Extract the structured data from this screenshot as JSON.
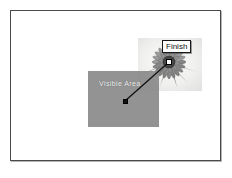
{
  "canvas": {
    "width": 232,
    "height": 178,
    "background_color": "#ffffff",
    "frame_border_color": "#4a4a4a"
  },
  "frame": {
    "name": "slide-frame"
  },
  "photo": {
    "subject": "flower-photograph",
    "description": "grayscale daisy flower",
    "background_color": "#f2f2f0",
    "petal_color": "#8e8e8e",
    "center_color": "#5a5a5a"
  },
  "visible_area": {
    "label": "Visible Area",
    "fill_color": "#8b8b8b",
    "label_color": "#f0f0f0"
  },
  "callout": {
    "label": "Finish",
    "background_color": "#ffffff",
    "border_color": "#1a1a1a",
    "text_color": "#111111"
  },
  "connector": {
    "line_color": "#111111",
    "start_point": {
      "x": 114,
      "y": 90
    },
    "end_point": {
      "x": 158,
      "y": 51
    }
  },
  "markers": {
    "start": {
      "name": "start-marker",
      "fill": "#121212"
    },
    "end": {
      "name": "end-marker",
      "fill": "#ffffff"
    }
  }
}
